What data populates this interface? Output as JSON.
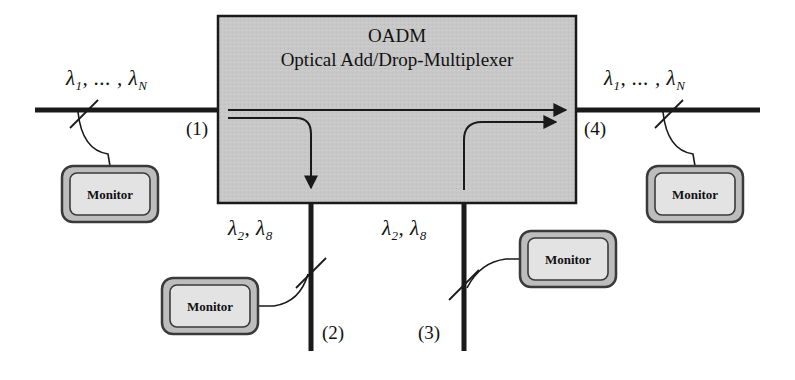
{
  "diagram": {
    "title": "OADM",
    "subtitle": "Optical Add/Drop-Multiplexer",
    "block_fill": "#c8c8c8",
    "block_stroke": "#1a1a1a",
    "fiber_color": "#1a1a1a",
    "monitor_body_fill": "#bdbdbd",
    "monitor_screen_fill": "#e3e3e3"
  },
  "labels": {
    "lambda_in_prefix": "λ",
    "lambda_in_1": "1",
    "lambda_in_ellipsis": ", ... , ",
    "lambda_in_N": "N",
    "left_wavelengths": "λ1, ... , λN",
    "right_wavelengths": "λ1, ... , λN",
    "drop_wavelengths": "λ2, λ8",
    "add_wavelengths": "λ2, λ8"
  },
  "ports": [
    {
      "id": "port-1",
      "label": "(1)",
      "role": "input"
    },
    {
      "id": "port-2",
      "label": "(2)",
      "role": "drop"
    },
    {
      "id": "port-3",
      "label": "(3)",
      "role": "add"
    },
    {
      "id": "port-4",
      "label": "(4)",
      "role": "output"
    }
  ],
  "monitors": [
    {
      "id": "monitor-input",
      "label": "Monitor"
    },
    {
      "id": "monitor-drop",
      "label": "Monitor"
    },
    {
      "id": "monitor-add",
      "label": "Monitor"
    },
    {
      "id": "monitor-output",
      "label": "Monitor"
    }
  ]
}
